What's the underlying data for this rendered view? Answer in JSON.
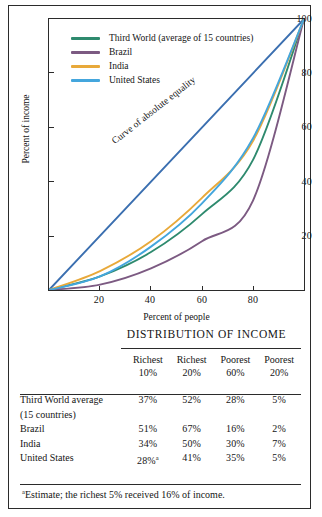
{
  "chart_data": {
    "type": "line",
    "title": "",
    "xlabel": "Percent of people",
    "ylabel": "Percent of income",
    "xlim": [
      0,
      100
    ],
    "ylim": [
      0,
      100
    ],
    "xticks": [
      20,
      40,
      60,
      80
    ],
    "yticks": [
      20,
      40,
      60,
      80,
      100
    ],
    "grid": false,
    "legend_position": "top-left",
    "annotation": "Curve of absolute equality",
    "x": [
      0,
      20,
      40,
      60,
      80,
      100
    ],
    "series": [
      {
        "name": "Curve of absolute equality",
        "color": "#3b6fb0",
        "values": [
          0,
          20,
          40,
          60,
          80,
          100
        ],
        "in_legend": false
      },
      {
        "name": "Third World (average of 15 countries)",
        "color": "#2e8a6e",
        "values": [
          0,
          5,
          14,
          28,
          48,
          100
        ],
        "in_legend": true
      },
      {
        "name": "Brazil",
        "color": "#7c5a82",
        "values": [
          0,
          2,
          8,
          18,
          33,
          100
        ],
        "in_legend": true
      },
      {
        "name": "India",
        "color": "#e8a93a",
        "values": [
          0,
          7,
          18,
          34,
          55,
          100
        ],
        "in_legend": true
      },
      {
        "name": "United States",
        "color": "#44a6dd",
        "values": [
          0,
          5,
          16,
          32,
          56,
          100
        ],
        "in_legend": true
      }
    ]
  },
  "chart": {
    "ylabel": "Percent of income",
    "xlabel": "Percent of people",
    "ytick_labels": [
      "100",
      "80",
      "60",
      "40",
      "20"
    ],
    "xtick_labels": [
      "20",
      "40",
      "60",
      "80"
    ],
    "equality_annotation": "Curve of absolute equality",
    "legend": [
      {
        "label": "Third World (average of 15 countries)",
        "color": "#2e8a6e"
      },
      {
        "label": "Brazil",
        "color": "#7c5a82"
      },
      {
        "label": "India",
        "color": "#e8a93a"
      },
      {
        "label": "United States",
        "color": "#44a6dd"
      }
    ]
  },
  "table": {
    "title": "DISTRIBUTION OF INCOME",
    "columns": [
      {
        "line1": "Richest",
        "line2": "10%"
      },
      {
        "line1": "Richest",
        "line2": "20%"
      },
      {
        "line1": "Poorest",
        "line2": "60%"
      },
      {
        "line1": "Poorest",
        "line2": "20%"
      }
    ],
    "rows": [
      {
        "label_line1": "Third World average",
        "label_line2": "(15 countries)",
        "values": [
          "37%",
          "52%",
          "28%",
          "5%"
        ]
      },
      {
        "label_line1": "Brazil",
        "label_line2": "",
        "values": [
          "51%",
          "67%",
          "16%",
          "2%"
        ]
      },
      {
        "label_line1": "India",
        "label_line2": "",
        "values": [
          "34%",
          "50%",
          "30%",
          "7%"
        ]
      },
      {
        "label_line1": "United States",
        "label_line2": "",
        "values": [
          "28%",
          "41%",
          "35%",
          "5%"
        ],
        "value_superscript_index": 0,
        "value_superscript": "a"
      }
    ],
    "footnote_marker": "a",
    "footnote": "Estimate; the richest 5% received 16% of income."
  }
}
